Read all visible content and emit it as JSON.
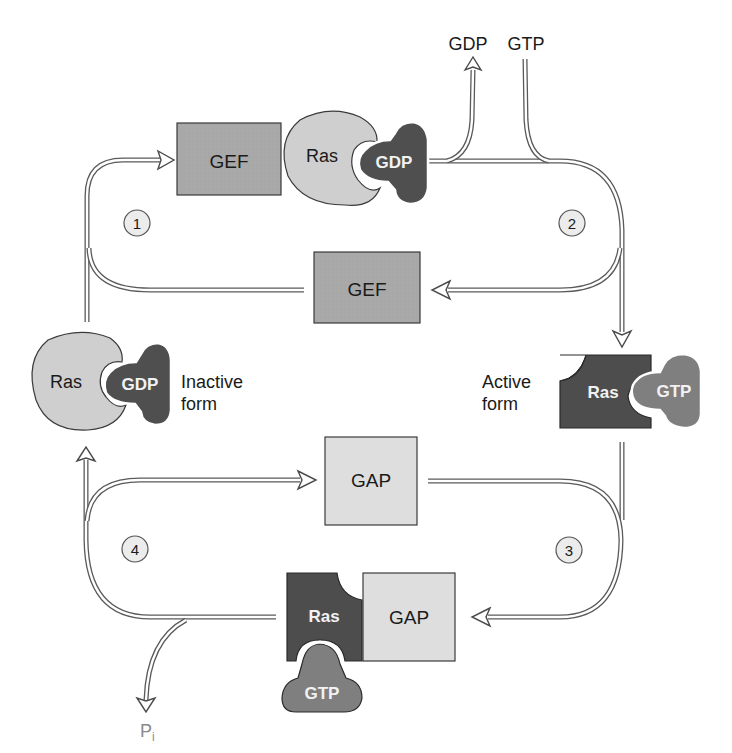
{
  "diagram": {
    "colors": {
      "gef": "#a9a9a9",
      "gap": "#dedede",
      "ras_inactive": "#cfcfcf",
      "ras_active": "#4d4d4d",
      "gdp": "#4f4f4f",
      "gtp": "#7f7f7f",
      "step_circle": "#ececec",
      "arrow": "#5a5a5a"
    },
    "nodes": {
      "gef_complex": {
        "gef": "GEF",
        "ras": "Ras",
        "nucleotide": "GDP"
      },
      "gef_free": {
        "label": "GEF"
      },
      "inactive_ras": {
        "ras": "Ras",
        "nucleotide": "GDP",
        "state_line1": "Inactive",
        "state_line2": "form"
      },
      "active_ras": {
        "ras": "Ras",
        "nucleotide": "GTP",
        "state_line1": "Active",
        "state_line2": "form"
      },
      "gap_free": {
        "label": "GAP"
      },
      "gap_complex": {
        "ras": "Ras",
        "gap": "GAP",
        "nucleotide": "GTP"
      }
    },
    "exchange": {
      "released": "GDP",
      "bound": "GTP"
    },
    "hydrolysis_product": {
      "base": "P",
      "subscript": "i"
    },
    "steps": [
      "1",
      "2",
      "3",
      "4"
    ]
  }
}
